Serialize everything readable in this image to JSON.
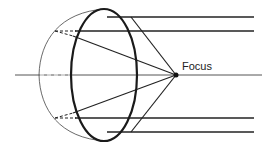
{
  "diagram": {
    "labels": {
      "focus": "Focus"
    },
    "colors": {
      "stroke": "#222222",
      "thin_stroke": "#444444",
      "axis": "#555555",
      "background": "#ffffff"
    },
    "elements": [
      "optical-axis",
      "lens-ellipse",
      "sphere-arc",
      "parallel-rays",
      "converging-rays",
      "dashed-extensions",
      "focus-point"
    ]
  }
}
